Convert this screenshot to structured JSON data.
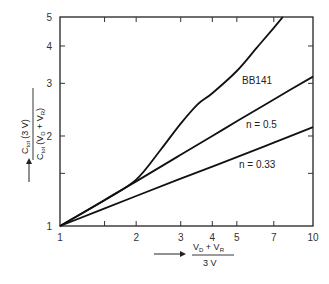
{
  "chart_data": {
    "type": "line",
    "title": "",
    "xscale": "log",
    "yscale": "log",
    "xlim": [
      1,
      10
    ],
    "ylim": [
      1,
      5
    ],
    "xticks": [
      1,
      2,
      3,
      4,
      5,
      7,
      10
    ],
    "xtick_labels": [
      "1",
      "2",
      "3",
      "4",
      "5",
      "7",
      "10"
    ],
    "yticks": [
      1,
      2,
      3,
      4,
      5
    ],
    "ytick_labels": [
      "1",
      "2",
      "3",
      "4",
      "5"
    ],
    "minor_xticks": [
      1.5
    ],
    "minor_yticks": [
      1.5
    ],
    "xlabel": {
      "numerator": "V_D + V_R",
      "denominator": "3 V"
    },
    "ylabel": {
      "numerator": "C_tot (3 V)",
      "denominator": "C_tot (V_D + V_R)"
    },
    "grid": false,
    "legend": "inline labels",
    "series": [
      {
        "name": "BB141",
        "x": [
          1,
          1.5,
          2,
          2.5,
          3,
          3.5,
          4,
          5,
          6,
          7,
          7.6
        ],
        "y": [
          1,
          1.22,
          1.43,
          1.8,
          2.2,
          2.55,
          2.78,
          3.3,
          3.95,
          4.6,
          5.0
        ]
      },
      {
        "name": "n = 0.5",
        "x": [
          1,
          2,
          3,
          4,
          5,
          7,
          10
        ],
        "y": [
          1,
          1.41,
          1.73,
          2.0,
          2.24,
          2.65,
          3.16
        ]
      },
      {
        "name": "n = 0.33",
        "x": [
          1,
          2,
          3,
          4,
          5,
          7,
          10
        ],
        "y": [
          1,
          1.26,
          1.44,
          1.58,
          1.7,
          1.9,
          2.14
        ]
      }
    ]
  },
  "labels": {
    "bb141": "BB141",
    "n05": "n = 0.5",
    "n033": "n = 0.33",
    "x_num_a": "V",
    "x_num_a_sub": "D",
    "x_num_plus": " + V",
    "x_num_b_sub": "R",
    "x_den": "3 V",
    "y_num": "C",
    "y_num_sub": "tot",
    "y_num_rest": "(3 V)",
    "y_den": "C",
    "y_den_sub": "tot",
    "y_den_rest1": "(V",
    "y_den_sub2": "D",
    "y_den_rest2": " + V",
    "y_den_sub3": "R",
    "y_den_rest3": ")"
  }
}
